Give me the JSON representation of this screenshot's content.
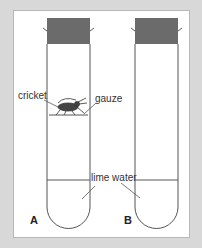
{
  "diagram": {
    "labels": {
      "cricket": "cricket",
      "gauze": "gauze",
      "lime_water": "lime water",
      "tube_a": "A",
      "tube_b": "B"
    },
    "colors": {
      "background": "#d8d8d8",
      "panel": "#ffffff",
      "stopper": "#6b6b6b",
      "outline": "#555555"
    }
  }
}
